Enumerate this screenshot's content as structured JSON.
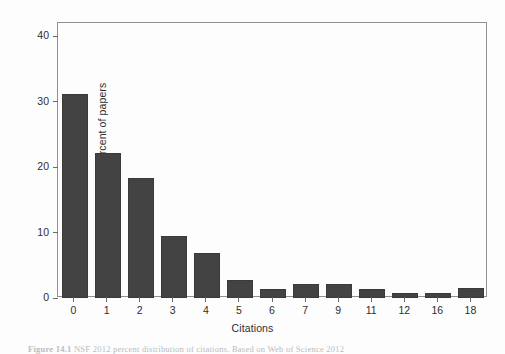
{
  "figure": {
    "background_color": "#fdfdfd",
    "frame_color": "#909090",
    "bar_color": "#434343",
    "text_color": "#2e2e2e"
  },
  "caption": {
    "label": "Figure 14.1",
    "text": "  NSF 2012 percent distribution of citations. Based on Web of Science 2012"
  },
  "chart_data": {
    "type": "bar",
    "title": "",
    "xlabel": "Citations",
    "ylabel": "Percent of papers",
    "categories": [
      "0",
      "1",
      "2",
      "3",
      "4",
      "5",
      "6",
      "7",
      "9",
      "11",
      "12",
      "16",
      "18"
    ],
    "values": [
      31.2,
      22.2,
      18.4,
      9.5,
      6.8,
      2.7,
      1.4,
      2.2,
      2.2,
      1.4,
      0.8,
      0.8,
      1.5
    ],
    "ylim": [
      0,
      42
    ],
    "yticks": [
      0,
      10,
      20,
      30,
      40
    ],
    "ytick_labels": [
      "0",
      "10",
      "20",
      "30",
      "40"
    ],
    "grid": false,
    "legend": null,
    "legend_position": "none"
  }
}
